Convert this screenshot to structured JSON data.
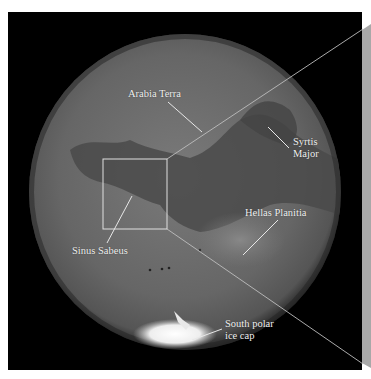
{
  "figure": {
    "inset_box": "zoom region outline",
    "labels": {
      "arabia_terra": "Arabia Terra",
      "syrtis_major_line1": "Syrtis",
      "syrtis_major_line2": "Major",
      "hellas_planitia": "Hellas Planitia",
      "sinus_sabeus": "Sinus Sabeus",
      "south_polar_line1": "South polar",
      "south_polar_line2": "ice cap"
    }
  },
  "colors": {
    "background": "#000000",
    "planet": "#6e6e6e",
    "label": "#f2f2f2",
    "panel": "#a8a8a8"
  }
}
